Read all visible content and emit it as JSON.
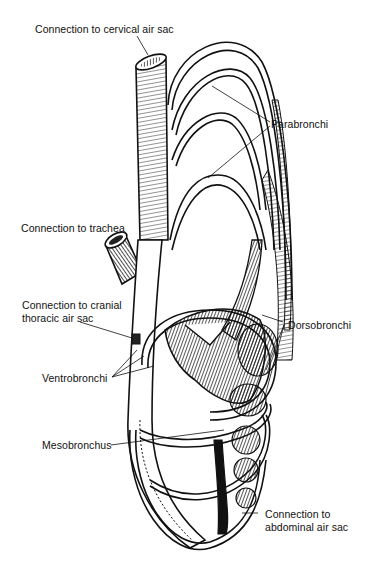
{
  "figure": {
    "labels": {
      "cervical": "Connection to cervical air sac",
      "parabronchi": "Parabronchi",
      "trachea": "Connection to trachea",
      "cranial_line1": "Connection to cranial",
      "cranial_line2": "thoracic air sac",
      "dorsobronchi": "Dorsobronchi",
      "ventrobronchi": "Ventrobronchi",
      "mesobronchus": "Mesobronchus",
      "abdominal_line1": "Connection to",
      "abdominal_line2": "abdominal air sac"
    },
    "colors": {
      "ink": "#111111",
      "background": "#ffffff"
    }
  }
}
